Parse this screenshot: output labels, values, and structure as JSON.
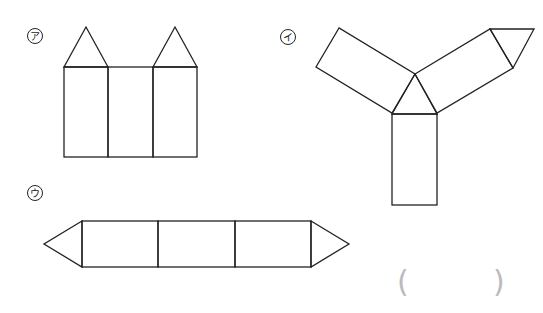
{
  "figures": [
    {
      "id": "a",
      "label": "ア",
      "description": "Net of triangular prism: three rectangles side-by-side with two triangles on top"
    },
    {
      "id": "i",
      "label": "イ",
      "description": "Net: central triangle with three rectangles radiating, one extra triangle at end"
    },
    {
      "id": "u",
      "label": "ウ",
      "description": "Net: three rectangles in a row with triangles at both ends"
    }
  ],
  "answer": {
    "open_paren": "(",
    "close_paren": ")",
    "value": ""
  },
  "colors": {
    "stroke": "#222222",
    "paren": "#bbbbbb",
    "background": "#ffffff"
  }
}
